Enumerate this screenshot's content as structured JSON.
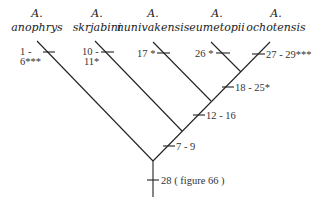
{
  "taxa": [
    {
      "genus": "A.",
      "species": "anophrys",
      "characters": "1 - 6***"
    },
    {
      "genus": "A.",
      "species": "skrjabini",
      "characters": "10 - 11*"
    },
    {
      "genus": "A.",
      "species": "nunivakensis",
      "characters": "17 *"
    },
    {
      "genus": "A.",
      "species": "eumetopii",
      "characters": "26 *"
    },
    {
      "genus": "A.",
      "species": "ochotensis",
      "characters": "27 - 29***"
    }
  ],
  "labels": {
    "anophrys_line1": "1 -",
    "anophrys_line2": "6***",
    "skrjabini_line1": "10 -",
    "skrjabini_line2": "11*",
    "nunivakensis": "17 *",
    "eumetopii": "26 *",
    "ochotensis": "27 - 29***",
    "node_eumetopii_ochotensis": "18 - 25*",
    "node_nunivakensis": "12 - 16",
    "node_skrjabini": "7 - 9",
    "root": "28 ( figure 66 )"
  },
  "tree": {
    "type": "cladogram",
    "topology": "(anophrys,(skrjabini,(nunivakensis,(eumetopii,ochotensis))))"
  }
}
